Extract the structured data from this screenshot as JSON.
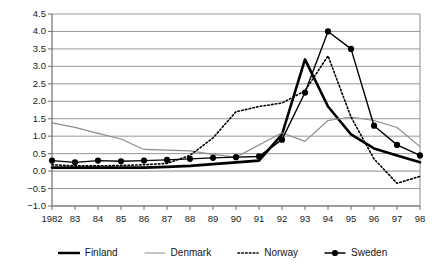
{
  "chart_data": {
    "type": "line",
    "title": "",
    "subtitle": "",
    "xlabel": "",
    "ylabel": "",
    "grid": true,
    "legend_position": "bottom",
    "xlim": [
      1982,
      1998
    ],
    "ylim": [
      -1.0,
      4.5
    ],
    "ytick_labels": [
      "4.5",
      "4.0",
      "3.5",
      "3.0",
      "2.5",
      "2.0",
      "1.5",
      "1.0",
      "0.5",
      "0.0",
      "−0.5",
      "−1.0"
    ],
    "ytick_values": [
      4.5,
      4.0,
      3.5,
      3.0,
      2.5,
      2.0,
      1.5,
      1.0,
      0.5,
      0.0,
      -0.5,
      -1.0
    ],
    "xtick_labels": [
      "1982",
      "83",
      "84",
      "85",
      "86",
      "87",
      "88",
      "89",
      "90",
      "91",
      "92",
      "93",
      "94",
      "95",
      "96",
      "97",
      "98"
    ],
    "x": [
      1982,
      1983,
      1984,
      1985,
      1986,
      1987,
      1988,
      1989,
      1990,
      1991,
      1992,
      1993,
      1994,
      1995,
      1996,
      1997,
      1998
    ],
    "series": [
      {
        "name": "Finland",
        "style": "solid-bold",
        "color": "#000000",
        "values": [
          0.1,
          0.1,
          0.1,
          0.1,
          0.1,
          0.12,
          0.15,
          0.2,
          0.25,
          0.3,
          1.05,
          3.2,
          1.85,
          1.05,
          0.65,
          0.45,
          0.25
        ]
      },
      {
        "name": "Denmark",
        "style": "solid-thin",
        "color": "#8c8c8c",
        "values": [
          1.38,
          1.25,
          1.08,
          0.92,
          0.62,
          0.6,
          0.58,
          0.48,
          0.4,
          0.75,
          1.1,
          0.85,
          1.45,
          1.55,
          1.45,
          1.25,
          0.7
        ]
      },
      {
        "name": "Norway",
        "style": "dotted",
        "color": "#000000",
        "values": [
          0.18,
          0.15,
          0.15,
          0.16,
          0.18,
          0.22,
          0.45,
          0.95,
          1.7,
          1.85,
          1.95,
          2.3,
          3.3,
          1.55,
          0.35,
          -0.35,
          -0.15
        ]
      },
      {
        "name": "Sweden",
        "style": "solid-marker",
        "color": "#000000",
        "values": [
          0.3,
          0.25,
          0.3,
          0.28,
          0.3,
          0.32,
          0.35,
          0.38,
          0.4,
          0.42,
          0.9,
          2.25,
          4.0,
          3.5,
          1.3,
          0.75,
          0.45
        ]
      }
    ],
    "legend": [
      {
        "label": "Finland",
        "swatch": "solid-bold-swatch"
      },
      {
        "label": "Denmark",
        "swatch": "solid-thin-swatch"
      },
      {
        "label": "Norway",
        "swatch": "dotted-swatch"
      },
      {
        "label": "Sweden",
        "swatch": "marker-swatch"
      }
    ],
    "colors": {
      "axis": "#6e6e6e",
      "grid": "#8c8c8c",
      "finland": "#000000",
      "denmark": "#8c8c8c",
      "norway": "#000000",
      "sweden": "#000000"
    }
  }
}
